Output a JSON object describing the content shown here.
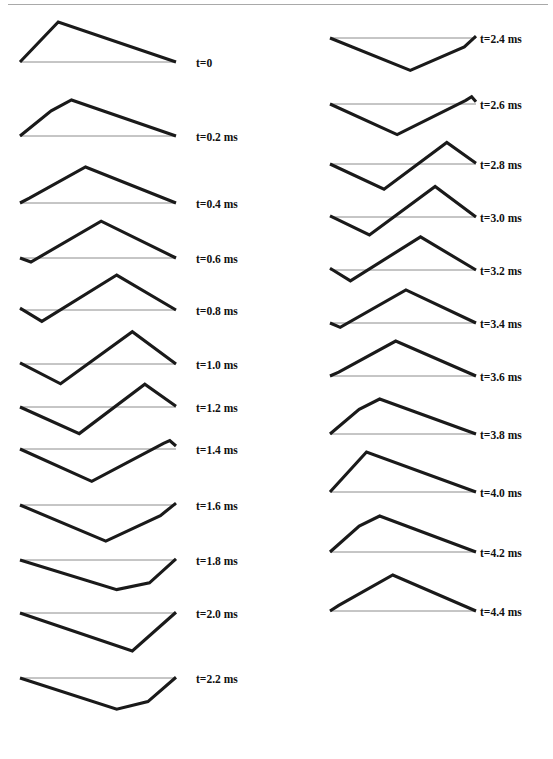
{
  "figure": {
    "kind": "wave-propagation-snapshot-series",
    "top_rule_color": "#a9a9a9",
    "baseline_color": "#8c8c8c",
    "wave_color": "#1a1a1a",
    "background_color": "#ffffff",
    "panel_width": 160,
    "panel_amplitude_units": 1.0
  },
  "chart_data": {
    "type": "line",
    "title": "",
    "xlabel": "",
    "ylabel": "",
    "xlim": [
      0,
      1
    ],
    "ylim": [
      -1,
      1
    ],
    "grid": false,
    "legend": null,
    "columns": [
      {
        "name": "left-column",
        "panels": [
          {
            "label": "t=0",
            "time_ms": 0,
            "x": [
              0.0,
              0.245,
              1.0
            ],
            "y": [
              0.0,
              1.0,
              0.0
            ]
          },
          {
            "label": "t=0.2 ms",
            "time_ms": 0.2,
            "x": [
              0.0,
              0.2,
              0.33,
              1.0
            ],
            "y": [
              0.0,
              0.63,
              0.9,
              0.0
            ]
          },
          {
            "label": "t=0.4 ms",
            "time_ms": 0.4,
            "x": [
              0.0,
              0.06,
              0.42,
              1.0
            ],
            "y": [
              0.0,
              0.12,
              0.9,
              0.0
            ]
          },
          {
            "label": "t=0.6 ms",
            "time_ms": 0.6,
            "x": [
              0.0,
              0.07,
              0.52,
              1.0
            ],
            "y": [
              0.0,
              -0.1,
              0.92,
              0.0
            ]
          },
          {
            "label": "t=0.8 ms",
            "time_ms": 0.8,
            "x": [
              0.0,
              0.14,
              0.62,
              1.0
            ],
            "y": [
              0.05,
              -0.3,
              0.92,
              0.0
            ]
          },
          {
            "label": "t=1.0 ms",
            "time_ms": 1.0,
            "x": [
              0.0,
              0.26,
              0.72,
              1.0
            ],
            "y": [
              0.03,
              -0.52,
              0.85,
              0.0
            ]
          },
          {
            "label": "t=1.2 ms",
            "time_ms": 1.2,
            "x": [
              0.0,
              0.38,
              0.8,
              1.0
            ],
            "y": [
              0.0,
              -0.7,
              0.6,
              0.02
            ]
          },
          {
            "label": "t=1.4 ms",
            "time_ms": 1.4,
            "x": [
              0.0,
              0.46,
              0.92,
              0.96,
              1.0
            ],
            "y": [
              0.0,
              -0.85,
              0.15,
              0.22,
              0.08
            ]
          },
          {
            "label": "t=1.6 ms",
            "time_ms": 1.6,
            "x": [
              0.0,
              0.55,
              0.9,
              1.0
            ],
            "y": [
              0.0,
              -0.95,
              -0.28,
              0.05
            ]
          },
          {
            "label": "t=1.8 ms",
            "time_ms": 1.8,
            "x": [
              0.0,
              0.62,
              0.83,
              1.0
            ],
            "y": [
              0.0,
              -0.78,
              -0.6,
              0.03
            ]
          },
          {
            "label": "t=2.0 ms",
            "time_ms": 2.0,
            "x": [
              0.0,
              0.72,
              1.0
            ],
            "y": [
              0.0,
              -1.0,
              0.02
            ]
          },
          {
            "label": "t=2.2 ms",
            "time_ms": 2.2,
            "x": [
              0.0,
              0.62,
              0.82,
              1.0
            ],
            "y": [
              0.0,
              -0.82,
              -0.62,
              0.02
            ]
          }
        ]
      },
      {
        "name": "right-column",
        "panels": [
          {
            "label": "t=2.4 ms",
            "time_ms": 2.4,
            "x": [
              0.0,
              0.55,
              0.92,
              1.0
            ],
            "y": [
              0.0,
              -0.9,
              -0.25,
              0.05
            ]
          },
          {
            "label": "t=2.6 ms",
            "time_ms": 2.6,
            "x": [
              0.0,
              0.46,
              0.93,
              0.97,
              1.0
            ],
            "y": [
              0.0,
              -0.85,
              0.1,
              0.2,
              0.06
            ]
          },
          {
            "label": "t=2.8 ms",
            "time_ms": 2.8,
            "x": [
              0.0,
              0.37,
              0.8,
              1.0
            ],
            "y": [
              0.0,
              -0.7,
              0.6,
              0.02
            ]
          },
          {
            "label": "t=3.0 ms",
            "time_ms": 3.0,
            "x": [
              0.0,
              0.27,
              0.72,
              1.0
            ],
            "y": [
              0.03,
              -0.5,
              0.85,
              0.0
            ]
          },
          {
            "label": "t=3.2 ms",
            "time_ms": 3.2,
            "x": [
              0.0,
              0.14,
              0.62,
              1.0
            ],
            "y": [
              0.05,
              -0.3,
              0.92,
              0.0
            ]
          },
          {
            "label": "t=3.4 ms",
            "time_ms": 3.4,
            "x": [
              0.0,
              0.07,
              0.52,
              1.0
            ],
            "y": [
              0.0,
              -0.12,
              0.92,
              0.0
            ]
          },
          {
            "label": "t=3.6 ms",
            "time_ms": 3.6,
            "x": [
              0.0,
              0.06,
              0.45,
              1.0
            ],
            "y": [
              0.0,
              0.1,
              0.92,
              0.0
            ]
          },
          {
            "label": "t=3.8 ms",
            "time_ms": 3.8,
            "x": [
              0.0,
              0.2,
              0.34,
              1.0
            ],
            "y": [
              0.0,
              0.65,
              0.92,
              0.0
            ]
          },
          {
            "label": "t=4.0 ms",
            "time_ms": 4.0,
            "x": [
              0.0,
              0.25,
              1.0
            ],
            "y": [
              0.0,
              1.0,
              0.0
            ]
          },
          {
            "label": "t=4.2 ms",
            "time_ms": 4.2,
            "x": [
              0.0,
              0.2,
              0.34,
              1.0
            ],
            "y": [
              0.0,
              0.65,
              0.9,
              0.0
            ]
          },
          {
            "label": "t=4.4 ms",
            "time_ms": 4.4,
            "x": [
              0.0,
              0.06,
              0.43,
              1.0
            ],
            "y": [
              0.0,
              0.14,
              0.9,
              0.0
            ]
          }
        ]
      }
    ]
  }
}
